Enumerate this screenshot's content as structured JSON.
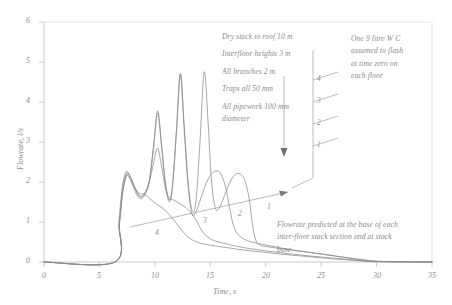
{
  "chart_data": {
    "type": "line",
    "title": "",
    "xlabel": "Time, s",
    "ylabel": "Flowrate, l/s",
    "xlim": [
      0,
      35
    ],
    "ylim": [
      0,
      6
    ],
    "xticks": [
      "0",
      "5",
      "10",
      "15",
      "20",
      "25",
      "30",
      "35"
    ],
    "yticks": [
      "0",
      "1",
      "2",
      "3",
      "4",
      "5",
      "6"
    ],
    "grid": false,
    "legend": "none",
    "series": [
      {
        "name": "1",
        "label": "1",
        "description": "Flowrate at stack base",
        "points": [
          [
            0,
            0
          ],
          [
            6.4,
            0
          ],
          [
            6.8,
            0.95
          ],
          [
            7.1,
            1.75
          ],
          [
            7.45,
            2.18
          ],
          [
            7.8,
            2.1
          ],
          [
            8.3,
            1.78
          ],
          [
            8.7,
            1.62
          ],
          [
            9.1,
            1.72
          ],
          [
            9.5,
            2.05
          ],
          [
            9.9,
            2.95
          ],
          [
            10.25,
            3.78
          ],
          [
            10.6,
            2.95
          ],
          [
            10.95,
            2.0
          ],
          [
            11.3,
            1.55
          ],
          [
            11.6,
            1.95
          ],
          [
            11.95,
            3.3
          ],
          [
            12.3,
            4.72
          ],
          [
            12.65,
            3.4
          ],
          [
            13.0,
            2.0
          ],
          [
            13.35,
            1.3
          ],
          [
            13.7,
            1.5
          ],
          [
            14.05,
            2.9
          ],
          [
            14.45,
            4.75
          ],
          [
            14.8,
            3.5
          ],
          [
            15.1,
            2.05
          ],
          [
            15.45,
            1.35
          ],
          [
            15.8,
            1.35
          ],
          [
            16.2,
            1.6
          ],
          [
            16.7,
            1.95
          ],
          [
            17.2,
            2.18
          ],
          [
            17.7,
            2.2
          ],
          [
            18.1,
            2.05
          ],
          [
            18.5,
            1.6
          ],
          [
            18.8,
            0.95
          ],
          [
            19.1,
            0.55
          ],
          [
            19.5,
            0.42
          ],
          [
            20.2,
            0.38
          ],
          [
            21.5,
            0.33
          ],
          [
            23,
            0.27
          ],
          [
            25,
            0.2
          ],
          [
            27,
            0.12
          ],
          [
            29,
            0.05
          ],
          [
            30.5,
            0.01
          ],
          [
            35,
            0
          ]
        ]
      },
      {
        "name": "2",
        "label": "2",
        "description": "Flowrate at base of inter-floor stack section 2",
        "points": [
          [
            0,
            0
          ],
          [
            6.4,
            0
          ],
          [
            6.8,
            0.95
          ],
          [
            7.1,
            1.75
          ],
          [
            7.45,
            2.15
          ],
          [
            7.8,
            2.05
          ],
          [
            8.3,
            1.72
          ],
          [
            8.7,
            1.58
          ],
          [
            9.1,
            1.68
          ],
          [
            9.5,
            2.0
          ],
          [
            9.9,
            2.9
          ],
          [
            10.25,
            3.72
          ],
          [
            10.6,
            2.9
          ],
          [
            10.95,
            1.95
          ],
          [
            11.3,
            1.5
          ],
          [
            11.6,
            1.9
          ],
          [
            11.95,
            3.25
          ],
          [
            12.3,
            4.68
          ],
          [
            12.65,
            3.3
          ],
          [
            13.0,
            1.9
          ],
          [
            13.35,
            1.2
          ],
          [
            13.7,
            1.25
          ],
          [
            14.1,
            1.55
          ],
          [
            14.6,
            1.95
          ],
          [
            15.1,
            2.2
          ],
          [
            15.6,
            2.28
          ],
          [
            16.0,
            2.18
          ],
          [
            16.4,
            1.85
          ],
          [
            16.75,
            1.35
          ],
          [
            17.05,
            0.95
          ],
          [
            17.4,
            0.72
          ],
          [
            18,
            0.58
          ],
          [
            19,
            0.48
          ],
          [
            20.5,
            0.4
          ],
          [
            22,
            0.32
          ],
          [
            24,
            0.24
          ],
          [
            26,
            0.16
          ],
          [
            28,
            0.08
          ],
          [
            30,
            0.02
          ],
          [
            35,
            0
          ]
        ]
      },
      {
        "name": "3",
        "label": "3",
        "description": "Flowrate at base of inter-floor stack section 3",
        "points": [
          [
            0,
            0
          ],
          [
            6.4,
            0
          ],
          [
            6.8,
            0.98
          ],
          [
            7.1,
            1.8
          ],
          [
            7.45,
            2.22
          ],
          [
            7.8,
            2.12
          ],
          [
            8.3,
            1.8
          ],
          [
            8.7,
            1.65
          ],
          [
            9.1,
            1.72
          ],
          [
            9.5,
            2.0
          ],
          [
            9.9,
            2.5
          ],
          [
            10.25,
            2.85
          ],
          [
            10.6,
            2.4
          ],
          [
            10.95,
            1.85
          ],
          [
            11.3,
            1.6
          ],
          [
            11.7,
            1.55
          ],
          [
            12.1,
            1.48
          ],
          [
            12.6,
            1.4
          ],
          [
            13.1,
            1.28
          ],
          [
            13.6,
            1.1
          ],
          [
            14.0,
            0.9
          ],
          [
            14.4,
            0.72
          ],
          [
            14.9,
            0.6
          ],
          [
            15.5,
            0.52
          ],
          [
            16.5,
            0.45
          ],
          [
            18,
            0.36
          ],
          [
            20,
            0.28
          ],
          [
            22,
            0.21
          ],
          [
            24,
            0.15
          ],
          [
            26,
            0.1
          ],
          [
            28,
            0.05
          ],
          [
            30,
            0.01
          ],
          [
            35,
            0
          ]
        ]
      },
      {
        "name": "4",
        "label": "4",
        "description": "Flowrate at base of inter-floor stack section 4 (top)",
        "points": [
          [
            0,
            0
          ],
          [
            6.4,
            0
          ],
          [
            6.75,
            1.0
          ],
          [
            7.05,
            1.85
          ],
          [
            7.4,
            2.25
          ],
          [
            7.75,
            2.15
          ],
          [
            8.2,
            1.85
          ],
          [
            8.6,
            1.72
          ],
          [
            9.0,
            1.7
          ],
          [
            9.4,
            1.62
          ],
          [
            9.9,
            1.5
          ],
          [
            10.4,
            1.4
          ],
          [
            10.9,
            1.3
          ],
          [
            11.4,
            1.15
          ],
          [
            11.9,
            0.98
          ],
          [
            12.4,
            0.8
          ],
          [
            12.9,
            0.65
          ],
          [
            13.4,
            0.55
          ],
          [
            14,
            0.48
          ],
          [
            15,
            0.42
          ],
          [
            16.5,
            0.36
          ],
          [
            18,
            0.3
          ],
          [
            20,
            0.24
          ],
          [
            22,
            0.18
          ],
          [
            24,
            0.13
          ],
          [
            26,
            0.08
          ],
          [
            28,
            0.04
          ],
          [
            30,
            0.01
          ],
          [
            35,
            0
          ]
        ]
      }
    ]
  },
  "annotations": {
    "spec_block": {
      "lines": [
        "Dry stack to roof 10 m",
        "Interfloor heights 3 m",
        "All branches 2 m",
        "Traps all 50 mm",
        "All pipework 100 mm",
        "diameter"
      ]
    },
    "wc_block": {
      "lines": [
        "One 9 litre W C",
        "assumed to flash",
        "at time zero on",
        "each floor"
      ]
    },
    "base_block": {
      "lines": [
        "Flowrate predicted at the base of each",
        "inter-floor stack section and at stack",
        "base"
      ]
    },
    "stack_diagram": {
      "floor_labels": [
        "4",
        "3",
        "2",
        "1"
      ]
    },
    "curve_callout_labels": [
      "4",
      "3",
      "2",
      "1"
    ]
  },
  "colors": {
    "ink": "#8d8d8d",
    "curve": "#8a8a8a",
    "axis": "#b8b8b8",
    "background": "#ffffff"
  }
}
